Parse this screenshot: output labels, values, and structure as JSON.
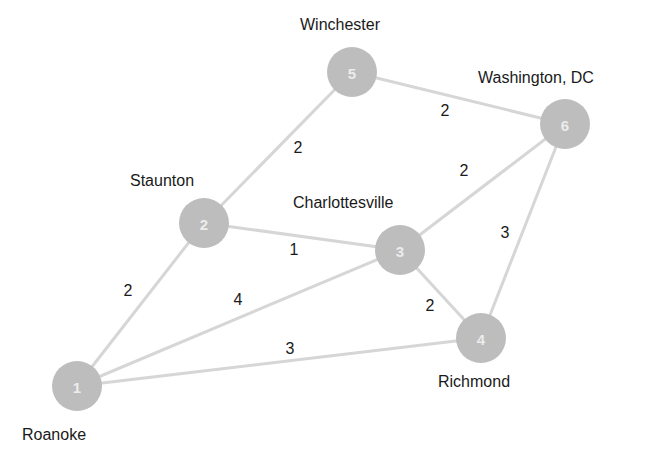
{
  "diagram": {
    "type": "weighted-undirected-graph",
    "node_color": "#bdbdbd",
    "edge_color": "#d6d6d6",
    "nodes": [
      {
        "id": "1",
        "label": "Roanoke",
        "x": 77,
        "y": 386,
        "label_x": 22,
        "label_y": 440,
        "label_anchor": "start"
      },
      {
        "id": "2",
        "label": "Staunton",
        "x": 204,
        "y": 223,
        "label_x": 130,
        "label_y": 186,
        "label_anchor": "start"
      },
      {
        "id": "3",
        "label": "Charlottesville",
        "x": 400,
        "y": 250,
        "label_x": 293,
        "label_y": 208,
        "label_anchor": "start"
      },
      {
        "id": "4",
        "label": "Richmond",
        "x": 481,
        "y": 338,
        "label_x": 438,
        "label_y": 387,
        "label_anchor": "start"
      },
      {
        "id": "5",
        "label": "Winchester",
        "x": 352,
        "y": 72,
        "label_x": 300,
        "label_y": 30,
        "label_anchor": "start"
      },
      {
        "id": "6",
        "label": "Washington, DC",
        "x": 565,
        "y": 124,
        "label_x": 478,
        "label_y": 83,
        "label_anchor": "start"
      }
    ],
    "edges": [
      {
        "from": "1",
        "to": "2",
        "weight": "2",
        "label_x": 128,
        "label_y": 290
      },
      {
        "from": "1",
        "to": "3",
        "weight": "4",
        "label_x": 238,
        "label_y": 299
      },
      {
        "from": "1",
        "to": "4",
        "weight": "3",
        "label_x": 290,
        "label_y": 348
      },
      {
        "from": "2",
        "to": "3",
        "weight": "1",
        "label_x": 294,
        "label_y": 249
      },
      {
        "from": "2",
        "to": "5",
        "weight": "2",
        "label_x": 298,
        "label_y": 147
      },
      {
        "from": "5",
        "to": "6",
        "weight": "2",
        "label_x": 445,
        "label_y": 110
      },
      {
        "from": "3",
        "to": "6",
        "weight": "2",
        "label_x": 464,
        "label_y": 170
      },
      {
        "from": "6",
        "to": "4",
        "weight": "3",
        "label_x": 505,
        "label_y": 232
      },
      {
        "from": "3",
        "to": "4",
        "weight": "2",
        "label_x": 430,
        "label_y": 305
      }
    ]
  }
}
